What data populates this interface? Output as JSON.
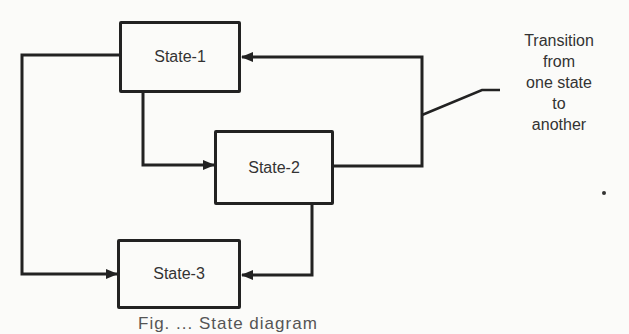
{
  "states": [
    {
      "id": "state-1",
      "label": "State-1"
    },
    {
      "id": "state-2",
      "label": "State-2"
    },
    {
      "id": "state-3",
      "label": "State-3"
    }
  ],
  "transitions": [
    {
      "from": "State-1",
      "to": "State-2"
    },
    {
      "from": "State-1",
      "to": "State-3"
    },
    {
      "from": "State-2",
      "to": "State-1"
    },
    {
      "from": "State-2",
      "to": "State-3"
    }
  ],
  "annotation": {
    "lines": [
      "Transition",
      "from",
      "one state",
      "to",
      "another"
    ]
  },
  "caption": {
    "text": "Fig. ... State diagram"
  },
  "colors": {
    "line": "#222222",
    "text": "#333333",
    "background": "#fbfbf9"
  }
}
